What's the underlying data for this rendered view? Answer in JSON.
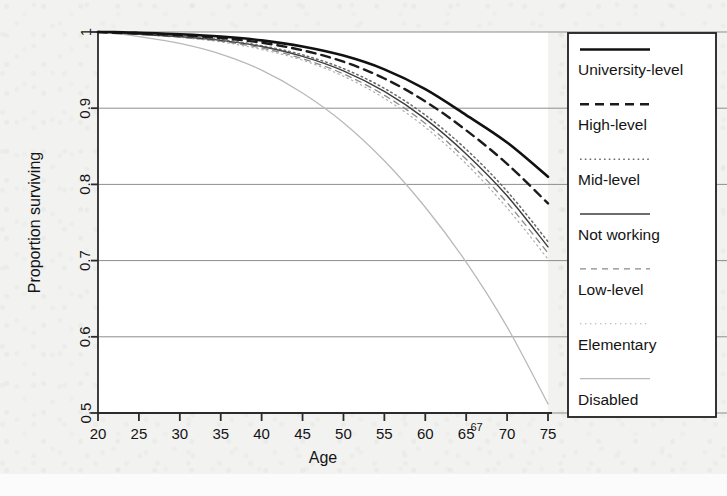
{
  "figure": {
    "background_color": "#f2f2f1",
    "plot_background_color": "#ffffff",
    "axis_color": "#2b2b2b",
    "grid_color": "#8d8d8d"
  },
  "chart_data": {
    "type": "line",
    "title": "",
    "xlabel": "Age",
    "ylabel": "Proportion surviving",
    "xlim": [
      20,
      75
    ],
    "ylim": [
      0.5,
      1.0
    ],
    "xticks": [
      20,
      25,
      30,
      35,
      40,
      45,
      50,
      55,
      60,
      65,
      70,
      75
    ],
    "xtick_labels": [
      "20",
      "25",
      "30",
      "35",
      "40",
      "45",
      "50",
      "55",
      "60",
      "65",
      "70",
      "75"
    ],
    "yticks": [
      0.5,
      0.6,
      0.7,
      0.8,
      0.9,
      1.0
    ],
    "ytick_labels": [
      "0.5",
      "0.6",
      "0.7",
      "0.8",
      "0.9",
      "1"
    ],
    "grid": "horizontal",
    "annotations": [
      {
        "text": "67",
        "x": 67,
        "axis": "x",
        "style": "superscript"
      }
    ],
    "legend_position": "right-outside",
    "x": [
      20,
      22,
      25,
      30,
      35,
      40,
      45,
      50,
      55,
      60,
      65,
      70,
      75
    ],
    "series": [
      {
        "name": "University-level",
        "style": "solid-thick",
        "color": "#111111",
        "width": 2.6,
        "values": [
          1.0,
          1.0,
          0.999,
          0.997,
          0.994,
          0.989,
          0.981,
          0.969,
          0.951,
          0.925,
          0.891,
          0.855,
          0.81
        ]
      },
      {
        "name": "High-level",
        "style": "dashed-thick",
        "color": "#1b1b1b",
        "width": 2.4,
        "values": [
          1.0,
          0.999,
          0.998,
          0.996,
          0.992,
          0.986,
          0.976,
          0.961,
          0.939,
          0.909,
          0.871,
          0.827,
          0.775
        ]
      },
      {
        "name": "Mid-level",
        "style": "dotted",
        "color": "#6a6a6a",
        "width": 1.5,
        "values": [
          1.0,
          0.999,
          0.998,
          0.995,
          0.99,
          0.982,
          0.97,
          0.952,
          0.926,
          0.891,
          0.846,
          0.791,
          0.725
        ]
      },
      {
        "name": "Not working",
        "style": "solid-thin",
        "color": "#3d3d3d",
        "width": 1.4,
        "values": [
          1.0,
          0.999,
          0.997,
          0.994,
          0.989,
          0.981,
          0.968,
          0.949,
          0.922,
          0.886,
          0.84,
          0.785,
          0.718
        ]
      },
      {
        "name": "Low-level",
        "style": "dashed-thin",
        "color": "#8a8a8a",
        "width": 1.3,
        "values": [
          1.0,
          0.999,
          0.997,
          0.993,
          0.988,
          0.979,
          0.965,
          0.945,
          0.917,
          0.88,
          0.833,
          0.776,
          0.71
        ]
      },
      {
        "name": "Elementary",
        "style": "dotted-faint",
        "color": "#adadad",
        "width": 1.2,
        "values": [
          1.0,
          0.999,
          0.997,
          0.993,
          0.987,
          0.977,
          0.963,
          0.942,
          0.913,
          0.875,
          0.827,
          0.769,
          0.702
        ]
      },
      {
        "name": "Disabled",
        "style": "solid-faint",
        "color": "#b9b9b9",
        "width": 1.3,
        "values": [
          1.0,
          0.998,
          0.994,
          0.985,
          0.971,
          0.95,
          0.92,
          0.881,
          0.831,
          0.77,
          0.698,
          0.613,
          0.512
        ]
      }
    ]
  },
  "legend": {
    "items": [
      {
        "label": "University-level",
        "style": "solid-thick"
      },
      {
        "label": "High-level",
        "style": "dashed-thick"
      },
      {
        "label": "Mid-level",
        "style": "dotted"
      },
      {
        "label": "Not working",
        "style": "solid-thin"
      },
      {
        "label": "Low-level",
        "style": "dashed-thin"
      },
      {
        "label": "Elementary",
        "style": "dotted-faint"
      },
      {
        "label": "Disabled",
        "style": "solid-faint"
      }
    ]
  }
}
